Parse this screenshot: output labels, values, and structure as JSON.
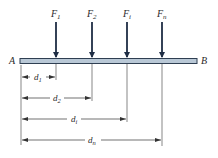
{
  "diagram": {
    "beam": {
      "left_label": "A",
      "right_label": "B",
      "fill_color": "#b9c8d6",
      "stroke_color": "#2f3f52"
    },
    "forces": [
      {
        "label": "F",
        "sub": "1",
        "x": 56
      },
      {
        "label": "F",
        "sub": "2",
        "x": 92
      },
      {
        "label": "F",
        "sub": "i",
        "x": 127
      },
      {
        "label": "F",
        "sub": "n",
        "x": 162
      }
    ],
    "dimensions": [
      {
        "label": "d",
        "sub": "1",
        "y": 77,
        "x_end": 56
      },
      {
        "label": "d",
        "sub": "2",
        "y": 98,
        "x_end": 92
      },
      {
        "label": "d",
        "sub": "i",
        "y": 119,
        "x_end": 127
      },
      {
        "label": "d",
        "sub": "n",
        "y": 140,
        "x_end": 162
      }
    ],
    "arrow_color": "#1f2d44"
  }
}
